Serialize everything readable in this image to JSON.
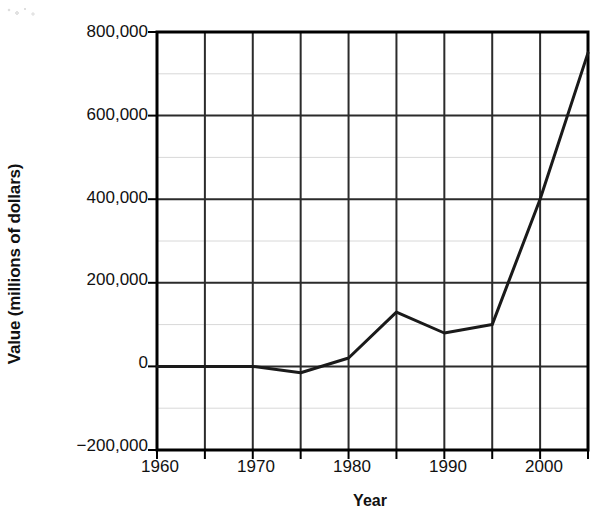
{
  "chart_data": {
    "type": "line",
    "title": "",
    "xlabel": "Year",
    "ylabel": "Value (millions of dollars)",
    "xlim": [
      1960,
      2005
    ],
    "ylim": [
      -200000,
      800000
    ],
    "grid": true,
    "legend": "none",
    "x_tick_labels": [
      "1960",
      "1970",
      "1980",
      "1990",
      "2000"
    ],
    "x_tick_values": [
      1960,
      1970,
      1980,
      1990,
      2000
    ],
    "x_minor_tick_values": [
      1965,
      1975,
      1985,
      1995,
      2005
    ],
    "y_tick_labels": [
      "800,000",
      "600,000",
      "400,000",
      "200,000",
      "0",
      "−200,000"
    ],
    "y_tick_values": [
      800000,
      600000,
      400000,
      200000,
      0,
      -200000
    ],
    "y_minor_tick_values": [
      700000,
      500000,
      300000,
      100000,
      -100000
    ],
    "x": [
      1960,
      1965,
      1970,
      1975,
      1980,
      1985,
      1990,
      1995,
      2000,
      2005
    ],
    "values": [
      0,
      0,
      0,
      -15000,
      20000,
      130000,
      80000,
      100000,
      400000,
      750000
    ],
    "series": [
      {
        "name": "Value",
        "color": "#1a1a1a",
        "x": [
          1960,
          1965,
          1970,
          1975,
          1980,
          1985,
          1990,
          1995,
          2000,
          2005
        ],
        "values": [
          0,
          0,
          0,
          -15000,
          20000,
          130000,
          80000,
          100000,
          400000,
          750000
        ]
      }
    ]
  },
  "style": {
    "line_color": "#1a1a1a",
    "axis_color": "#000000",
    "major_grid_color": "#2b2b2b",
    "minor_grid_color": "#d8d8d8",
    "text_color": "#111111",
    "background": "#ffffff"
  }
}
